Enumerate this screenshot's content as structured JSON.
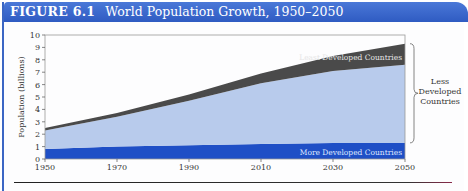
{
  "figure": {
    "number": "FIGURE 6.1",
    "title": "World Population Growth, 1950–2050"
  },
  "colors": {
    "header": "#3a67cc",
    "more_developed": "#1f4fc6",
    "less_developed": "#b8cbec",
    "least_developed": "#4a4a4a",
    "background": "#fdfdfe"
  },
  "chart_data": {
    "type": "area",
    "stacked": true,
    "title": "World Population Growth, 1950–2050",
    "xlabel": "",
    "ylabel": "Population (billions)",
    "x": [
      1950,
      1970,
      1990,
      2010,
      2030,
      2050
    ],
    "x_ticks": [
      "1950",
      "1970",
      "1990",
      "2010",
      "2030",
      "2050"
    ],
    "y_ticks": [
      "0",
      "1",
      "2",
      "3",
      "4",
      "5",
      "6",
      "7",
      "8",
      "9",
      "10"
    ],
    "ylim": [
      0,
      10
    ],
    "xlim": [
      1950,
      2050
    ],
    "grid": false,
    "series": [
      {
        "name": "More Developed Countries",
        "values": [
          0.8,
          1.0,
          1.1,
          1.2,
          1.3,
          1.3
        ]
      },
      {
        "name": "Less Developed Countries (excl. least developed)",
        "values": [
          1.5,
          2.4,
          3.6,
          4.9,
          5.8,
          6.3
        ]
      },
      {
        "name": "Least Developed Countries",
        "values": [
          0.2,
          0.3,
          0.5,
          0.8,
          1.2,
          1.7
        ]
      }
    ],
    "annotations": [
      {
        "text": "More Developed Countries",
        "position": "inside bottom band, right"
      },
      {
        "text": "Least Developed Countries",
        "position": "inside top dark band, right"
      },
      {
        "text": "Less Developed Countries",
        "position": "right brace spanning least + less developed"
      }
    ]
  },
  "labels": {
    "ylabel": "Population (billions)",
    "more_developed": "More Developed Countries",
    "least_developed": "Least Developed Countries",
    "brace_line1": "Less",
    "brace_line2": "Developed",
    "brace_line3": "Countries"
  }
}
